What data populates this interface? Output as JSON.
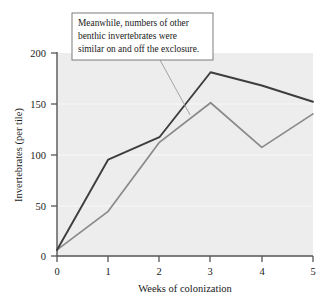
{
  "chart_data": {
    "type": "line",
    "title": "",
    "xlabel": "Weeks of colonization",
    "ylabel": "Invertebrates (per tile)",
    "x": [
      0,
      1,
      2,
      3,
      4,
      5
    ],
    "xlim": [
      0,
      5
    ],
    "ylim": [
      0,
      200
    ],
    "xticks": [
      "0",
      "1",
      "2",
      "3",
      "4",
      "5"
    ],
    "yticks": [
      "0",
      "50",
      "100",
      "150",
      "200"
    ],
    "grid": false,
    "legend": "none",
    "series": [
      {
        "name": "exclosure",
        "color": "#3d3d3d",
        "values": [
          6,
          95,
          117,
          181,
          168,
          152
        ]
      },
      {
        "name": "control",
        "color": "#8a8a8a",
        "values": [
          6,
          44,
          112,
          151,
          107,
          140
        ]
      }
    ],
    "annotations": [
      {
        "name": "callout",
        "lines": [
          "Meanwhile, numbers of other",
          "benthic invertebrates were",
          "similar on and off the exclosure."
        ],
        "points_to_x": 2.6,
        "points_to_y": 139
      }
    ],
    "plot_background": "#ededed",
    "axis_color": "#555555"
  },
  "labels": {
    "y_200": "200",
    "y_150": "150",
    "y_100": "100",
    "y_50": "50",
    "y_0": "0",
    "x_0": "0",
    "x_1": "1",
    "x_2": "2",
    "x_3": "3",
    "x_4": "4",
    "x_5": "5",
    "x_title": "Weeks of colonization",
    "y_title": "Invertebrates (per tile)",
    "callout_line1": "Meanwhile, numbers of other",
    "callout_line2": "benthic invertebrates were",
    "callout_line3": "similar on and off the exclosure."
  }
}
